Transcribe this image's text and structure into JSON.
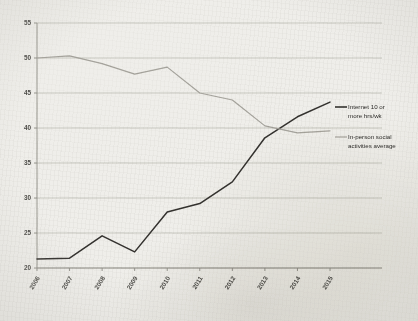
{
  "chart_data": {
    "type": "line",
    "title": "",
    "xlabel": "",
    "ylabel": "",
    "grid": true,
    "legend_position": "right",
    "categories": [
      "2006",
      "2007",
      "2008",
      "2009",
      "2010",
      "2011",
      "2012",
      "2013",
      "2014",
      "2015"
    ],
    "x": [
      2006,
      2007,
      2008,
      2009,
      2010,
      2011,
      2012,
      2013,
      2014,
      2015
    ],
    "ylim": [
      20,
      55
    ],
    "yticks": [
      20,
      25,
      30,
      35,
      40,
      45,
      50,
      55
    ],
    "series": [
      {
        "name": "Internet 10 or more hrs/wk",
        "color": "#34322f",
        "values": [
          21.3,
          21.4,
          24.6,
          22.3,
          28.0,
          29.2,
          32.3,
          38.6,
          41.6,
          43.7
        ]
      },
      {
        "name": "In-person social activities average",
        "color": "#a5a39c",
        "values": [
          50.0,
          50.3,
          49.2,
          47.7,
          48.7,
          45.0,
          44.0,
          40.3,
          39.3,
          39.6
        ]
      }
    ]
  },
  "axis": {
    "y_tick_labels": [
      "55",
      "50",
      "45",
      "40",
      "35",
      "30",
      "25",
      "20"
    ],
    "x_tick_labels": [
      "2006",
      "2007",
      "2008",
      "2009",
      "2010",
      "2011",
      "2012",
      "2013",
      "2014",
      "2015"
    ]
  },
  "legend": {
    "entries": [
      {
        "label_line1": "Internet 10 or",
        "label_line2": "more hrs/wk",
        "color": "#34322f"
      },
      {
        "label_line1": "In-person social",
        "label_line2": "activities average",
        "color": "#a5a39c"
      }
    ]
  }
}
